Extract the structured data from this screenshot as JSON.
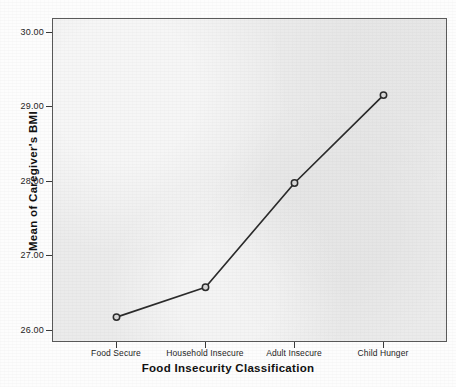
{
  "chart_data": {
    "type": "line",
    "title": "",
    "subtitle": "",
    "xlabel": "Food Insecurity Classification",
    "ylabel": "Mean of Caregiver's BMI",
    "categories": [
      "Food Secure",
      "Household Insecure",
      "Adult Insecure",
      "Child Hunger"
    ],
    "values": [
      26.18,
      26.58,
      27.98,
      29.16
    ],
    "series": [
      {
        "name": "Mean of Caregiver's BMI",
        "values": [
          26.18,
          26.58,
          27.98,
          29.16
        ]
      }
    ],
    "ylim": [
      25.55,
      30.25
    ],
    "yticks": [
      26.0,
      27.0,
      28.0,
      29.0,
      30.0
    ],
    "ytick_labels": [
      "26.00",
      "27.00",
      "28.00",
      "29.00",
      "30.00"
    ],
    "xtick_labels": [
      "Food Secure",
      "Household Insecure",
      "Adult Insecure",
      "Child Hunger"
    ],
    "grid": false,
    "legend": "none",
    "marker": "open-circle",
    "line_color": "#2b2b2b",
    "marker_fill": "#d8d8d8",
    "panel_color": "#ebebeb",
    "axis_color": "#5a5a5a"
  },
  "axes": {
    "y_title": "Mean of Caregiver's BMI",
    "x_title": "Food Insecurity Classification"
  }
}
